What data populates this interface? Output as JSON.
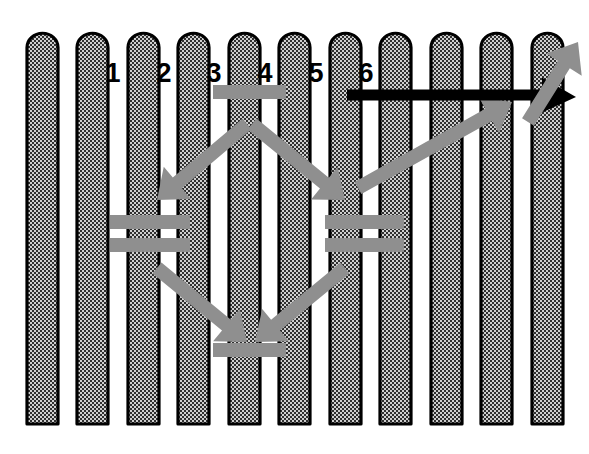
{
  "figure": {
    "canvas": {
      "width": 589,
      "height": 454
    },
    "background_color": "#ffffff",
    "picket_fill_color": "#3a3a3a",
    "picket_outline_color": "#000000",
    "bar_gray_color": "#8f8f8f",
    "bar_black_color": "#000000",
    "number_color": "#000000"
  },
  "margin_label": {
    "text": "2",
    "x": -5,
    "y": 28,
    "note": "partially cropped digit at the left page margin"
  },
  "fence": {
    "picket_count": 11,
    "picket_width": 31,
    "picket_pitch": 50.5,
    "first_picket_x": 27,
    "top_y": 32,
    "bottom_y": 424,
    "top_shape": "rounded-scallop",
    "pickets": [
      {
        "index": 1,
        "x": 27
      },
      {
        "index": 2,
        "x": 77
      },
      {
        "index": 3,
        "x": 128
      },
      {
        "index": 4,
        "x": 178
      },
      {
        "index": 5,
        "x": 229
      },
      {
        "index": 6,
        "x": 279
      },
      {
        "index": 7,
        "x": 330
      },
      {
        "index": 8,
        "x": 380
      },
      {
        "index": 9,
        "x": 431
      },
      {
        "index": 10,
        "x": 481
      },
      {
        "index": 11,
        "x": 532
      }
    ]
  },
  "gap_numbers": {
    "font_size": 27,
    "baseline_y": 82,
    "items": [
      {
        "label": "1",
        "x": 113,
        "y": 58
      },
      {
        "label": "2",
        "x": 164,
        "y": 58
      },
      {
        "label": "3",
        "x": 214,
        "y": 58
      },
      {
        "label": "4",
        "x": 265,
        "y": 58
      },
      {
        "label": "5",
        "x": 316,
        "y": 58
      },
      {
        "label": "6",
        "x": 366,
        "y": 58
      }
    ]
  },
  "gray_bars": {
    "color": "#8f8f8f",
    "thickness": 14,
    "horizontal": [
      {
        "name": "top-cross-bar",
        "x1": 213,
        "y1": 92,
        "x2": 286,
        "y2": 92
      },
      {
        "name": "left-upper-bar",
        "x1": 110,
        "y1": 222,
        "x2": 190,
        "y2": 222
      },
      {
        "name": "left-lower-bar",
        "x1": 110,
        "y1": 245,
        "x2": 190,
        "y2": 245
      },
      {
        "name": "right-upper-bar",
        "x1": 325,
        "y1": 222,
        "x2": 404,
        "y2": 222
      },
      {
        "name": "right-lower-bar",
        "x1": 325,
        "y1": 245,
        "x2": 404,
        "y2": 245
      },
      {
        "name": "bottom-cross-bar",
        "x1": 213,
        "y1": 350,
        "x2": 286,
        "y2": 350
      }
    ],
    "diagonal": [
      {
        "name": "upper-left-diagonal",
        "x1": 247,
        "y1": 124,
        "x2": 157,
        "y2": 200
      },
      {
        "name": "upper-right-diagonal",
        "x1": 252,
        "y1": 124,
        "x2": 345,
        "y2": 200
      },
      {
        "name": "lower-left-diagonal",
        "x1": 157,
        "y1": 268,
        "x2": 247,
        "y2": 342
      },
      {
        "name": "lower-right-diagonal",
        "x1": 345,
        "y1": 268,
        "x2": 255,
        "y2": 342
      },
      {
        "name": "long-right-diagonal",
        "x1": 358,
        "y1": 188,
        "x2": 512,
        "y2": 102
      },
      {
        "name": "right-tip-diagonal",
        "x1": 528,
        "y1": 122,
        "x2": 578,
        "y2": 42
      }
    ]
  },
  "black_bar": {
    "name": "black-pointer-bar",
    "color": "#000000",
    "x1": 347,
    "y1": 95,
    "x2": 560,
    "y2": 95,
    "thickness": 11,
    "arrow_head": true,
    "arrow_tip_x": 576,
    "arrow_tip_y": 97
  }
}
